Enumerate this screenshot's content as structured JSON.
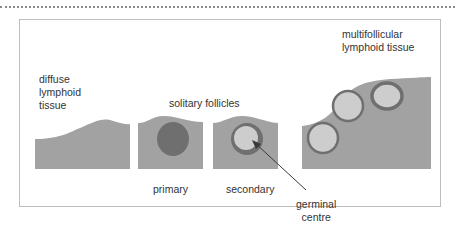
{
  "diagram": {
    "colors": {
      "tissue": "#a2a2a2",
      "primary_follicle": "#6f6f6f",
      "mantle_zone": "#6f6f6f",
      "germinal_centre": "#cdcdcd",
      "frame_border": "#bdbdbd",
      "arrow": "#3a3a3a"
    },
    "labels": {
      "diffuse": [
        "diffuse",
        "lymphoid",
        "tissue"
      ],
      "solitary_follicles": "solitary follicles",
      "multifollicular": [
        "multifollicular",
        "lymphoid tissue"
      ],
      "primary": "primary",
      "secondary": "secondary",
      "germinal_centre": [
        "germinal",
        "centre"
      ]
    },
    "panels": [
      {
        "name": "diffuse lymphoid tissue"
      },
      {
        "name": "primary follicle"
      },
      {
        "name": "secondary follicle"
      },
      {
        "name": "multifollicular lymphoid tissue"
      }
    ]
  }
}
